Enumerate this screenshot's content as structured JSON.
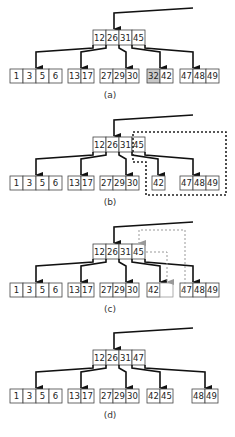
{
  "panels": [
    {
      "label": "(a)",
      "root": [
        "12",
        "26",
        "31",
        "45"
      ],
      "leaves": [
        {
          "keys": [
            "1",
            "3",
            "5",
            "6"
          ]
        },
        {
          "keys": [
            "13",
            "17"
          ]
        },
        {
          "keys": [
            "27",
            "29",
            "30"
          ]
        },
        {
          "keys": [
            "32",
            "42"
          ],
          "shaded": [
            0
          ]
        },
        {
          "keys": [
            "47",
            "48",
            "49"
          ]
        }
      ]
    },
    {
      "label": "(b)",
      "root": [
        "12",
        "26",
        "31",
        "45"
      ],
      "leaves": [
        {
          "keys": [
            "1",
            "3",
            "5",
            "6"
          ]
        },
        {
          "keys": [
            "13",
            "17"
          ]
        },
        {
          "keys": [
            "27",
            "29",
            "30"
          ]
        },
        {
          "keys": [
            "42"
          ]
        },
        {
          "keys": [
            "47",
            "48",
            "49"
          ]
        }
      ],
      "annotation": "dotted outline around key 45 and its child nodes"
    },
    {
      "label": "(c)",
      "root": [
        "12",
        "26",
        "31",
        "45"
      ],
      "leaves": [
        {
          "keys": [
            "1",
            "3",
            "5",
            "6"
          ]
        },
        {
          "keys": [
            "13",
            "17"
          ]
        },
        {
          "keys": [
            "27",
            "29",
            "30"
          ]
        },
        {
          "keys": [
            "42",
            ""
          ]
        },
        {
          "keys": [
            "47",
            "48",
            "49"
          ]
        }
      ],
      "annotation": "grey dashed arrows: 47 moves up into root, 45 moves down to leaf"
    },
    {
      "label": "(d)",
      "root": [
        "12",
        "26",
        "31",
        "47"
      ],
      "leaves": [
        {
          "keys": [
            "1",
            "3",
            "5",
            "6"
          ]
        },
        {
          "keys": [
            "13",
            "17"
          ]
        },
        {
          "keys": [
            "27",
            "29",
            "30"
          ]
        },
        {
          "keys": [
            "42",
            "45"
          ]
        },
        {
          "keys": [
            "48",
            "49"
          ]
        }
      ]
    }
  ]
}
